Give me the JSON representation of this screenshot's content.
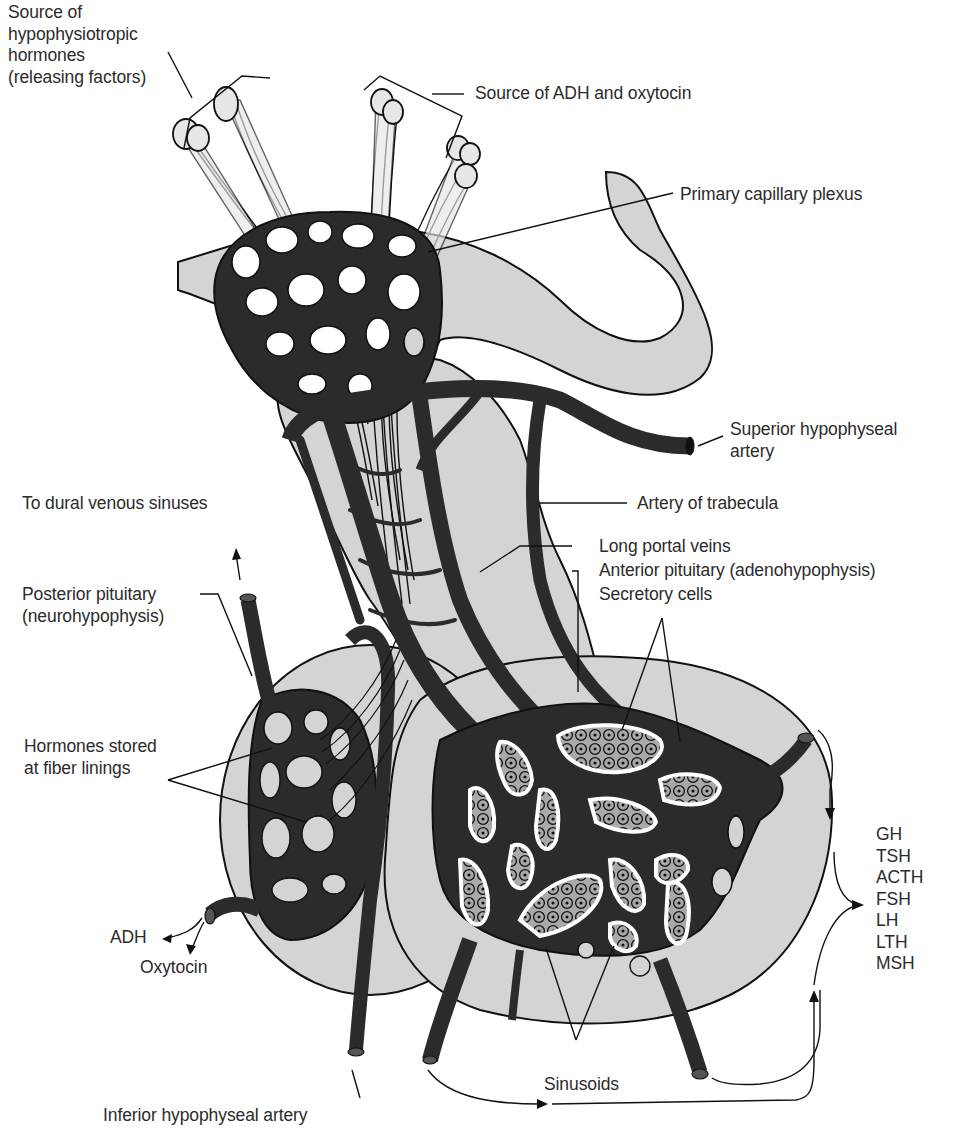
{
  "diagram": {
    "colors": {
      "background": "#ffffff",
      "tissue_gray": "#d4d4d4",
      "vessel_dark": "#2b2b2b",
      "cell_gray": "#a9a9a9",
      "outline": "#111111",
      "label_text": "#2b2b2b"
    },
    "labels": {
      "releasing_source": {
        "lines": [
          "Source of",
          "hypophysiotropic",
          "hormones",
          "(releasing factors)"
        ]
      },
      "adh_oxytocin_source": {
        "text": "Source of ADH and oxytocin"
      },
      "primary_plexus": {
        "text": "Primary capillary plexus"
      },
      "superior_artery": {
        "lines": [
          "Superior hypophyseal",
          "artery"
        ]
      },
      "dural_sinuses": {
        "text": "To dural venous sinuses"
      },
      "artery_trabecula": {
        "text": "Artery of trabecula"
      },
      "long_portal_veins": {
        "text": "Long portal veins"
      },
      "anterior_pituitary": {
        "text": "Anterior pituitary (adenohypophysis)"
      },
      "secretory_cells": {
        "text": "Secretory cells"
      },
      "posterior_pituitary": {
        "lines": [
          "Posterior pituitary",
          "(neurohypophysis)"
        ]
      },
      "hormones_stored": {
        "lines": [
          "Hormones stored",
          "at fiber linings"
        ]
      },
      "adh": {
        "text": "ADH"
      },
      "oxytocin": {
        "text": "Oxytocin"
      },
      "sinusoids": {
        "text": "Sinusoids"
      },
      "inferior_artery": {
        "text": "Inferior hypophyseal artery"
      }
    },
    "anterior_hormones": [
      "GH",
      "TSH",
      "ACTH",
      "FSH",
      "LH",
      "LTH",
      "MSH"
    ]
  }
}
